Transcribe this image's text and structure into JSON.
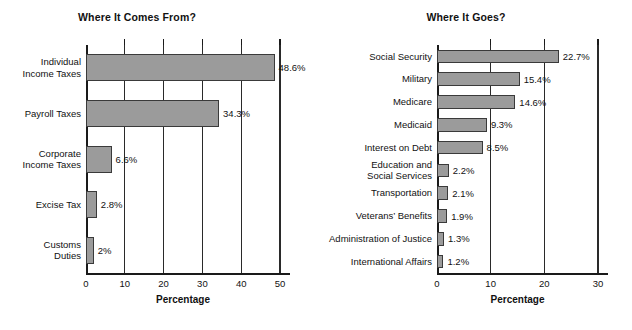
{
  "figure": {
    "background": "#ffffff",
    "bar_fill": "#9b9b9b",
    "bar_stroke": "#3a3a3a",
    "axis_color": "#1a1a1a"
  },
  "chart_data": [
    {
      "type": "bar",
      "orientation": "horizontal",
      "title": "Where It Comes From?",
      "xlabel": "Percentage",
      "ylabel": "",
      "xlim": [
        0,
        50
      ],
      "xticks": [
        0,
        10,
        20,
        30,
        40,
        50
      ],
      "xtick_labels": [
        "0",
        "10",
        "20",
        "30",
        "40",
        "50"
      ],
      "grid": true,
      "legend": "none",
      "categories": [
        "Individual\nIncome Taxes",
        "Payroll Taxes",
        "Corporate\nIncome Taxes",
        "Excise Tax",
        "Customs\nDuties"
      ],
      "values": [
        48.6,
        34.3,
        6.6,
        2.8,
        2
      ],
      "value_labels": [
        "48.6%",
        "34.3%",
        "6.6%",
        "2.8%",
        "2%"
      ]
    },
    {
      "type": "bar",
      "orientation": "horizontal",
      "title": "Where It Goes?",
      "xlabel": "Percentage",
      "ylabel": "",
      "xlim": [
        0,
        30
      ],
      "xticks": [
        0,
        10,
        20,
        30
      ],
      "xtick_labels": [
        "0",
        "10",
        "20",
        "30"
      ],
      "grid": true,
      "legend": "none",
      "categories": [
        "Social Security",
        "Military",
        "Medicare",
        "Medicaid",
        "Interest on Debt",
        "Education and\nSocial Services",
        "Transportation",
        "Veterans’ Benefits",
        "Administration of Justice",
        "International Affairs"
      ],
      "values": [
        22.7,
        15.4,
        14.6,
        9.3,
        8.5,
        2.2,
        2.1,
        1.9,
        1.3,
        1.2
      ],
      "value_labels": [
        "22.7%",
        "15.4%",
        "14.6%",
        "9.3%",
        "8.5%",
        "2.2%",
        "2.1%",
        "1.9%",
        "1.3%",
        "1.2%"
      ]
    }
  ]
}
